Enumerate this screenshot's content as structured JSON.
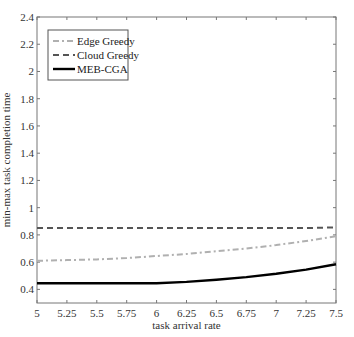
{
  "chart_data": {
    "type": "line",
    "title": "",
    "xlabel": "task arrival rate",
    "ylabel": "min-max task completion time",
    "xlim": [
      5,
      7.5
    ],
    "ylim": [
      0.3,
      2.4
    ],
    "x_ticks": [
      5,
      5.25,
      5.5,
      5.75,
      6,
      6.25,
      6.5,
      6.75,
      7,
      7.25,
      7.5
    ],
    "x_tick_labels": [
      "5",
      "5.25",
      "5.5",
      "5.75",
      "6",
      "6.25",
      "6.5",
      "6.75",
      "7",
      "7.25",
      "7.5"
    ],
    "y_ticks": [
      0.4,
      0.6,
      0.8,
      1,
      1.2,
      1.4,
      1.6,
      1.8,
      2,
      2.2,
      2.4
    ],
    "y_tick_labels": [
      "0.4",
      "0.6",
      "0.8",
      "1",
      "1.2",
      "1.4",
      "1.6",
      "1.8",
      "2",
      "2.2",
      "2.4"
    ],
    "grid": false,
    "legend_position": "upper left",
    "x": [
      5,
      5.25,
      5.5,
      5.75,
      6,
      6.25,
      6.5,
      6.75,
      7,
      7.25,
      7.5
    ],
    "series": [
      {
        "name": "Edge Greedy",
        "style": "dash-dot",
        "color": "#b0b0b0",
        "values": [
          0.61,
          0.615,
          0.62,
          0.63,
          0.645,
          0.66,
          0.68,
          0.7,
          0.725,
          0.755,
          0.79
        ]
      },
      {
        "name": "Cloud Greedy",
        "style": "dashed",
        "color": "#555555",
        "values": [
          0.85,
          0.85,
          0.85,
          0.85,
          0.85,
          0.85,
          0.85,
          0.85,
          0.85,
          0.85,
          0.855
        ]
      },
      {
        "name": "MEB-CGA",
        "style": "solid",
        "color": "#000000",
        "values": [
          0.445,
          0.445,
          0.445,
          0.445,
          0.445,
          0.455,
          0.47,
          0.49,
          0.515,
          0.545,
          0.585
        ]
      }
    ]
  }
}
